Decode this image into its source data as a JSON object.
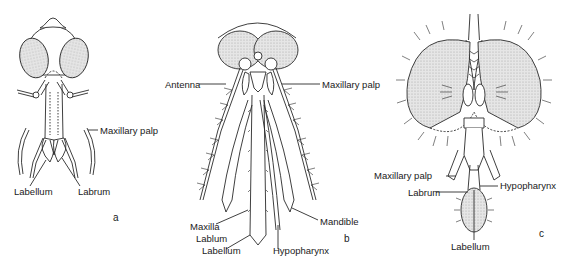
{
  "figure": {
    "colors": {
      "line": "#2a2a2a",
      "eye_fill": "#d8d8d8",
      "background": "#ffffff"
    },
    "panels": [
      {
        "id": "a",
        "letter": "a",
        "labels": {
          "maxillary_palp": "Maxillary palp",
          "labellum": "Labellum",
          "labrum": "Labrum"
        }
      },
      {
        "id": "b",
        "letter": "b",
        "labels": {
          "antenna": "Antenna",
          "maxillary_palp": "Maxillary palp",
          "maxilla": "Maxilla",
          "labium": "Lablum",
          "labellum": "Labellum",
          "hypopharynx": "Hypopharynx",
          "mandible": "Mandible"
        }
      },
      {
        "id": "c",
        "letter": "c",
        "labels": {
          "maxillary_palp": "Maxillary palp",
          "hypopharynx": "Hypopharynx",
          "labrum": "Labrum",
          "labellum": "Labellum"
        }
      }
    ]
  }
}
